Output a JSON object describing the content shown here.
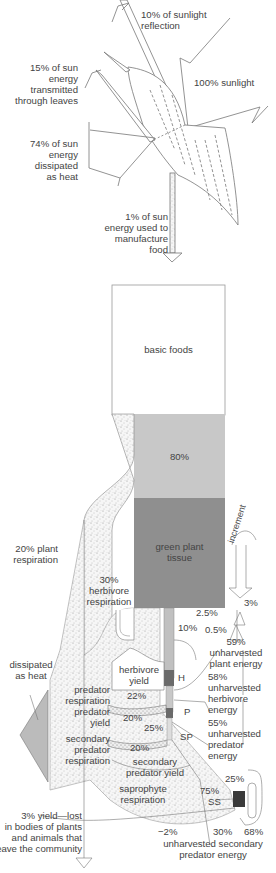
{
  "colors": {
    "basic_foods": "#ffffff",
    "eighty_pct": "#c8c8c8",
    "green_plant_tissue": "#8f8f8f",
    "herbivore_dark": "#6a6a6a",
    "stipple": "#f4f4f4",
    "line": "#777777",
    "text": "#444444",
    "ss_box": "#3a3a3a"
  },
  "leaf_section": {
    "reflection": [
      "10% of sunlight",
      "reflection"
    ],
    "sunlight": "100% sunlight",
    "transmitted": [
      "15% of sun",
      "energy",
      "transmitted",
      "through leaves"
    ],
    "heat": [
      "74% of sun",
      "energy",
      "dissipated",
      "as heat"
    ],
    "food": [
      "1% of sun",
      "energy used to",
      "manufacture",
      "food"
    ]
  },
  "energy_column": {
    "basic_foods": "basic foods",
    "eighty": "80%",
    "green_plant_tissue": [
      "green plant",
      "tissue"
    ]
  },
  "left_labels": {
    "plant_respiration": [
      "20% plant",
      "respiration"
    ],
    "herbivore_respiration": [
      "30%",
      "herbivore",
      "respiration"
    ],
    "dissipated": [
      "dissipated",
      "as heat"
    ],
    "predator_respiration": [
      "predator",
      "respiration"
    ],
    "predator_yield": [
      "predator",
      "yield"
    ],
    "secondary_predator_respiration": [
      "secondary",
      "predator",
      "respiration"
    ],
    "saprophyte_respiration": [
      "saprophyte",
      "respiration"
    ],
    "lost_yield": [
      "3% yield—lost",
      "in bodies of plants",
      "and animals that",
      "leave the community"
    ]
  },
  "center_labels": {
    "herbivore_yield": [
      "herbivore",
      "yield"
    ],
    "p22": "22%",
    "p20a": "20%",
    "p25": "25%",
    "p20b": "20%",
    "secondary_predator_yield": [
      "secondary",
      "predator yield"
    ],
    "p10": "10%",
    "H": "H",
    "P": "P",
    "SP": "SP",
    "SS": "SS",
    "p75": "75%",
    "p25b": "25%",
    "p30": "30%",
    "p68": "68%",
    "minus2": "−2%",
    "unharvested_secondary": [
      "unharvested secondary",
      "predator energy"
    ]
  },
  "right_labels": {
    "increment": "increment",
    "p3": "3%",
    "p2_5": "2.5%",
    "p0_5": "0.5%",
    "unharvested_plant": [
      "59%",
      "unharvested",
      "plant energy"
    ],
    "unharvested_herbivore": [
      "58%",
      "unharvested",
      "herbivore",
      "energy"
    ],
    "unharvested_predator": [
      "55%",
      "unharvested",
      "predator",
      "energy"
    ]
  }
}
